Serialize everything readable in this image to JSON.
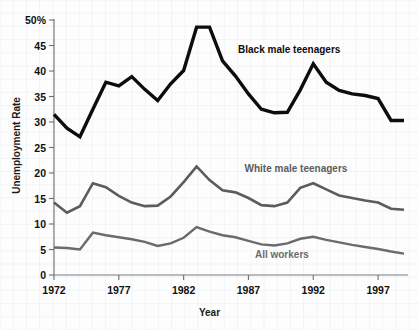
{
  "chart_data": {
    "type": "line",
    "title": "",
    "xlabel": "Year",
    "ylabel": "Unemployment Rate",
    "xlim": [
      1972,
      1999
    ],
    "ylim": [
      0,
      50
    ],
    "grid": true,
    "legend_position": "inline-annotations",
    "x": [
      1972,
      1973,
      1974,
      1975,
      1976,
      1977,
      1978,
      1979,
      1980,
      1981,
      1982,
      1983,
      1984,
      1985,
      1986,
      1987,
      1988,
      1989,
      1990,
      1991,
      1992,
      1993,
      1994,
      1995,
      1996,
      1997,
      1998,
      1999
    ],
    "y_ticks": [
      0,
      5,
      10,
      15,
      20,
      25,
      30,
      35,
      40,
      45,
      50
    ],
    "y_tick_labels": [
      "0",
      "5",
      "10",
      "15",
      "20",
      "25",
      "30",
      "35",
      "40",
      "45",
      "50%"
    ],
    "x_ticks": [
      1972,
      1977,
      1982,
      1987,
      1992,
      1997
    ],
    "x_tick_labels": [
      "1972",
      "1977",
      "1982",
      "1987",
      "1992",
      "1997"
    ],
    "series": [
      {
        "name": "Black male teenagers",
        "color": "#0d0d0d",
        "width": 3.4,
        "label_x": 1986.2,
        "label_y": 44.0,
        "values": [
          31.5,
          28.8,
          27.1,
          32.5,
          37.8,
          37.1,
          38.9,
          36.4,
          34.2,
          37.5,
          40.1,
          48.6,
          48.6,
          42.0,
          39.0,
          35.5,
          32.5,
          31.8,
          31.9,
          36.3,
          41.4,
          37.8,
          36.2,
          35.5,
          35.2,
          34.6,
          30.3,
          30.3
        ]
      },
      {
        "name": "White male teenagers",
        "color": "#5c5c5c",
        "width": 2.6,
        "label_x": 1986.7,
        "label_y": 20.6,
        "values": [
          14.2,
          12.2,
          13.5,
          18.0,
          17.2,
          15.5,
          14.2,
          13.5,
          13.6,
          15.4,
          18.2,
          21.3,
          18.6,
          16.6,
          16.2,
          15.1,
          13.7,
          13.5,
          14.2,
          17.1,
          18.0,
          16.8,
          15.6,
          15.1,
          14.6,
          14.2,
          13.0,
          12.8
        ]
      },
      {
        "name": "All workers",
        "color": "#6b6b6b",
        "width": 2.4,
        "label_x": 1987.5,
        "label_y": 3.8,
        "values": [
          5.4,
          5.3,
          5.0,
          8.3,
          7.8,
          7.4,
          7.0,
          6.5,
          5.7,
          6.2,
          7.3,
          9.4,
          8.5,
          7.8,
          7.4,
          6.7,
          6.0,
          5.8,
          6.2,
          7.1,
          7.5,
          6.9,
          6.4,
          5.9,
          5.5,
          5.1,
          4.6,
          4.2
        ]
      }
    ]
  },
  "axis": {
    "y_title": "Unemployment Rate",
    "x_title": "Year"
  }
}
